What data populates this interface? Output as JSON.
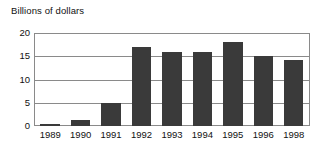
{
  "chart_data": {
    "type": "bar",
    "title": "Billions of dollars",
    "xlabel": "",
    "ylabel": "",
    "categories": [
      "1989",
      "1990",
      "1991",
      "1992",
      "1993",
      "1994",
      "1995",
      "1996",
      "1998"
    ],
    "values": [
      0.5,
      1.2,
      5.0,
      17.0,
      16.0,
      16.0,
      18.0,
      15.0,
      14.3
    ],
    "ylim": [
      0,
      20
    ],
    "yticks": [
      0,
      5,
      10,
      15,
      20
    ],
    "ytick_labels": [
      "0",
      "5",
      "10",
      "15",
      "20"
    ],
    "grid": true,
    "legend": false,
    "legend_position": "none",
    "bar_color": "#3a3a3a",
    "axis_color": "#8a8a8a",
    "background_color": "#ffffff",
    "note": "1997 omitted from category axis"
  }
}
